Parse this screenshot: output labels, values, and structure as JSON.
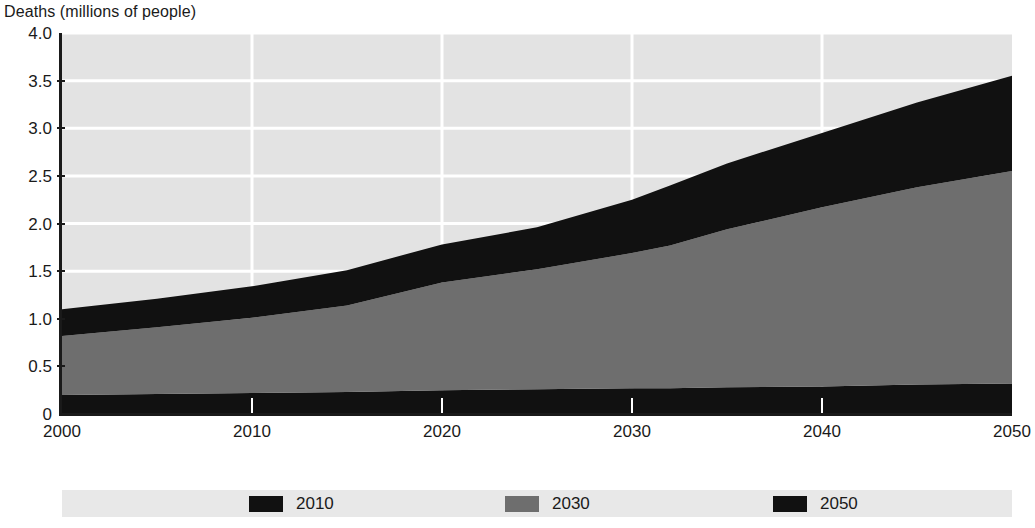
{
  "chart_data": {
    "type": "area",
    "title": "Deaths (millions of people)",
    "xlabel": "",
    "ylabel": "Deaths (millions of people)",
    "stacked": true,
    "grid": true,
    "legend_position": "bottom",
    "xlim": [
      2000,
      2050
    ],
    "ylim": [
      0,
      4.0
    ],
    "x": [
      2000,
      2005,
      2010,
      2015,
      2020,
      2025,
      2030,
      2032,
      2035,
      2040,
      2045,
      2050
    ],
    "y_ticks": [
      "0",
      "0.5",
      "1.0",
      "1.5",
      "2.0",
      "2.5",
      "3.0",
      "3.5",
      "4.0"
    ],
    "y_tick_values": [
      0,
      0.5,
      1.0,
      1.5,
      2.0,
      2.5,
      3.0,
      3.5,
      4.0
    ],
    "x_ticks": [
      "2000",
      "2010",
      "2020",
      "2030",
      "2040",
      "2050"
    ],
    "x_tick_values": [
      2000,
      2010,
      2020,
      2030,
      2040,
      2050
    ],
    "series": [
      {
        "name": "2010",
        "color": "#111111",
        "values": [
          0.2,
          0.21,
          0.22,
          0.23,
          0.25,
          0.26,
          0.27,
          0.27,
          0.28,
          0.29,
          0.31,
          0.32
        ]
      },
      {
        "name": "2030",
        "color": "#6e6e6e",
        "values": [
          0.62,
          0.7,
          0.79,
          0.91,
          1.13,
          1.26,
          1.42,
          1.5,
          1.66,
          1.88,
          2.07,
          2.23
        ]
      },
      {
        "name": "2050",
        "color": "#111111",
        "values": [
          0.28,
          0.3,
          0.33,
          0.37,
          0.4,
          0.44,
          0.56,
          0.63,
          0.69,
          0.78,
          0.89,
          1.0
        ]
      }
    ],
    "cumulative_totals": [
      1.1,
      1.21,
      1.34,
      1.51,
      1.78,
      1.96,
      2.25,
      2.4,
      2.63,
      2.95,
      3.27,
      3.55
    ],
    "colors": {
      "plot_background": "#e3e3e3",
      "gridline": "#ffffff",
      "axis": "#1a1a1a",
      "legend_background": "#e8e8e8",
      "band_dark": "#111111",
      "band_gray": "#6e6e6e"
    }
  },
  "legend": {
    "items": [
      {
        "label": "2010",
        "color": "#111111"
      },
      {
        "label": "2030",
        "color": "#6e6e6e"
      },
      {
        "label": "2050",
        "color": "#111111"
      }
    ]
  }
}
